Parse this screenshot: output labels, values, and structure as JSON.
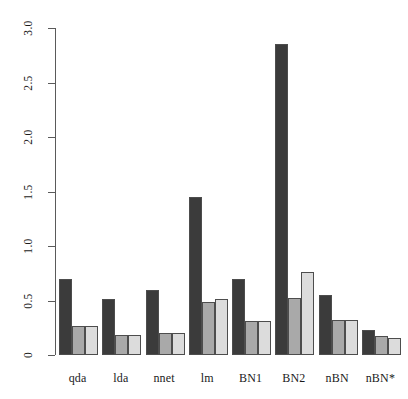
{
  "chart_data": {
    "type": "bar",
    "title": "",
    "subtitle": "",
    "xlabel": "",
    "ylabel": "",
    "categories": [
      "qda",
      "lda",
      "nnet",
      "lm",
      "BN1",
      "BN2",
      "nBN",
      "nBN*"
    ],
    "series": [
      {
        "name": "series-1",
        "color": "#3b3b3b",
        "values": [
          0.7,
          0.51,
          0.6,
          1.45,
          0.7,
          2.85,
          0.55,
          0.23
        ]
      },
      {
        "name": "series-2",
        "color": "#a9a9a9",
        "values": [
          0.27,
          0.18,
          0.2,
          0.49,
          0.31,
          0.52,
          0.32,
          0.17
        ]
      },
      {
        "name": "series-3",
        "color": "#dcdcdc",
        "values": [
          0.27,
          0.18,
          0.2,
          0.51,
          0.31,
          0.76,
          0.32,
          0.16
        ]
      }
    ],
    "ylim": [
      0,
      3.0
    ],
    "yticks": [
      0,
      0.5,
      1.0,
      1.5,
      2.0,
      2.5,
      3.0
    ],
    "ytick_labels": [
      "0",
      "0.5",
      "1.0",
      "1.5",
      "2.0",
      "2.5",
      "3.0"
    ],
    "grid": false,
    "legend": null,
    "axis_color": "#5a5a5a",
    "bar_border_color": "#4d4d4d",
    "background": "#ffffff"
  }
}
